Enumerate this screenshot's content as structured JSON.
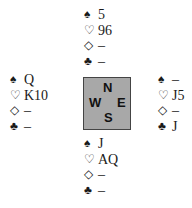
{
  "suits": {
    "spades": "♠",
    "hearts": "♡",
    "diamonds": "◇",
    "clubs": "♣"
  },
  "hands": {
    "north": {
      "spades": "5",
      "hearts": "96",
      "diamonds": "–",
      "clubs": "–"
    },
    "west": {
      "spades": "Q",
      "hearts": "K10",
      "diamonds": "–",
      "clubs": "–"
    },
    "east": {
      "spades": "–",
      "hearts": "J5",
      "diamonds": "–",
      "clubs": "J"
    },
    "south": {
      "spades": "J",
      "hearts": "AQ",
      "diamonds": "–",
      "clubs": "–"
    }
  },
  "compass": {
    "north": "N",
    "west": "W",
    "east": "E",
    "south": "S"
  },
  "colors": {
    "compass_fill": "#a8a8a8",
    "text": "#1a1a1a"
  }
}
